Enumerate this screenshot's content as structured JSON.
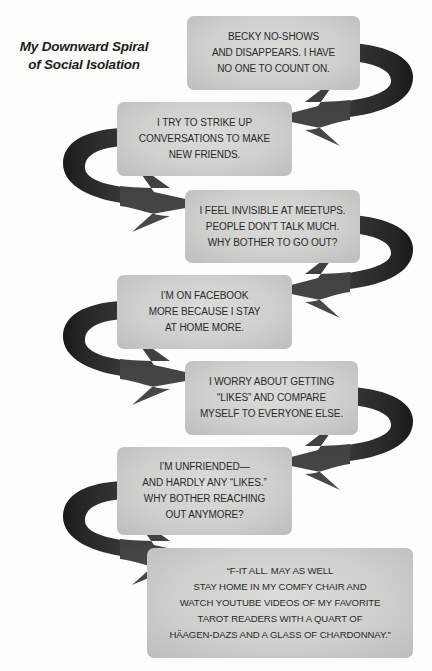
{
  "title": {
    "line1": "My Downward Spiral",
    "line2": "of Social Isolation"
  },
  "colors": {
    "background": "#fdfdfb",
    "box_fill": "#cfcfcd",
    "arrow_fill": "#2e2e2e",
    "text": "#2a2a2a"
  },
  "steps": [
    {
      "lines": [
        "BECKY NO-SHOWS",
        "AND DISAPPEARS. I HAVE",
        "NO ONE TO COUNT ON."
      ]
    },
    {
      "lines": [
        "I TRY TO STRIKE UP",
        "CONVERSATIONS TO MAKE",
        "NEW FRIENDS."
      ]
    },
    {
      "lines": [
        "I FEEL INVISIBLE AT MEETUPS.",
        "PEOPLE DON’T TALK MUCH.",
        "WHY BOTHER TO GO OUT?"
      ]
    },
    {
      "lines": [
        "I’M ON FACEBOOK",
        "MORE BECAUSE I STAY",
        "AT HOME MORE."
      ]
    },
    {
      "lines": [
        "I WORRY ABOUT GETTING",
        "“LIKES” AND COMPARE",
        "MYSELF TO EVERYONE ELSE."
      ]
    },
    {
      "lines": [
        "I’M UNFRIENDED—",
        "AND HARDLY ANY “LIKES.”",
        "WHY BOTHER REACHING",
        "OUT ANYMORE?"
      ]
    },
    {
      "lines": [
        "“F-IT ALL. MAY AS WELL",
        "STAY HOME IN MY COMFY CHAIR AND",
        "WATCH YOUTUBE VIDEOS OF MY FAVORITE",
        "TAROT READERS WITH A QUART OF",
        "HÄAGEN-DAZS AND A GLASS OF CHARDONNAY.”"
      ]
    }
  ]
}
